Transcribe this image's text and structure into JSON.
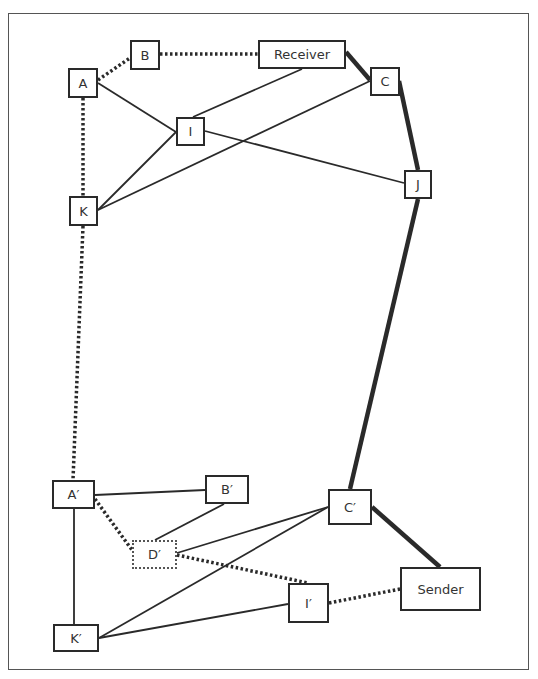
{
  "diagram": {
    "frame": {
      "x": 8,
      "y": 13,
      "w": 521,
      "h": 657
    },
    "nodes": {
      "A": {
        "label": "A",
        "x": 68,
        "y": 68,
        "w": 30,
        "h": 30
      },
      "B": {
        "label": "B",
        "x": 130,
        "y": 40,
        "w": 30,
        "h": 30
      },
      "Receiver": {
        "label": "Receiver",
        "x": 258,
        "y": 40,
        "w": 88,
        "h": 29
      },
      "C": {
        "label": "C",
        "x": 370,
        "y": 67,
        "w": 30,
        "h": 29
      },
      "I": {
        "label": "I",
        "x": 176,
        "y": 117,
        "w": 29,
        "h": 29
      },
      "J": {
        "label": "J",
        "x": 404,
        "y": 170,
        "w": 28,
        "h": 29
      },
      "K": {
        "label": "K",
        "x": 69,
        "y": 196,
        "w": 29,
        "h": 30
      },
      "A_prime": {
        "label": "A′",
        "x": 52,
        "y": 480,
        "w": 43,
        "h": 29
      },
      "B_prime": {
        "label": "B′",
        "x": 205,
        "y": 475,
        "w": 44,
        "h": 29
      },
      "C_prime": {
        "label": "C′",
        "x": 328,
        "y": 489,
        "w": 44,
        "h": 36
      },
      "D_prime": {
        "label": "D′",
        "x": 132,
        "y": 540,
        "w": 45,
        "h": 29,
        "style": "dotted"
      },
      "I_prime": {
        "label": "I′",
        "x": 288,
        "y": 583,
        "w": 41,
        "h": 40
      },
      "Sender": {
        "label": "Sender",
        "x": 400,
        "y": 567,
        "w": 81,
        "h": 44
      },
      "K_prime": {
        "label": "K′",
        "x": 53,
        "y": 624,
        "w": 46,
        "h": 28
      }
    },
    "edges": [
      {
        "from": "A",
        "to": "B",
        "style": "dotted",
        "x1": 98,
        "y1": 80,
        "x2": 130,
        "y2": 58
      },
      {
        "from": "B",
        "to": "Receiver",
        "style": "dotted",
        "x1": 160,
        "y1": 54,
        "x2": 258,
        "y2": 54
      },
      {
        "from": "Receiver",
        "to": "C",
        "style": "thick",
        "x1": 346,
        "y1": 52,
        "x2": 370,
        "y2": 80
      },
      {
        "from": "A",
        "to": "I",
        "style": "solid",
        "x1": 98,
        "y1": 83,
        "x2": 176,
        "y2": 132
      },
      {
        "from": "I",
        "to": "Receiver",
        "style": "solid",
        "x1": 193,
        "y1": 117,
        "x2": 302,
        "y2": 69
      },
      {
        "from": "I",
        "to": "J",
        "style": "solid",
        "x1": 205,
        "y1": 131,
        "x2": 404,
        "y2": 183
      },
      {
        "from": "K",
        "to": "I",
        "style": "solid",
        "x1": 98,
        "y1": 210,
        "x2": 176,
        "y2": 132
      },
      {
        "from": "K",
        "to": "C",
        "style": "solid",
        "x1": 98,
        "y1": 210,
        "x2": 370,
        "y2": 81
      },
      {
        "from": "C",
        "to": "J",
        "style": "thick",
        "x1": 399,
        "y1": 81,
        "x2": 418,
        "y2": 170
      },
      {
        "from": "A",
        "to": "K",
        "style": "dotted",
        "x1": 83,
        "y1": 98,
        "x2": 83,
        "y2": 196
      },
      {
        "from": "K",
        "to": "A_prime",
        "style": "dotted",
        "x1": 83,
        "y1": 226,
        "x2": 73,
        "y2": 480
      },
      {
        "from": "J",
        "to": "C_prime",
        "style": "thick",
        "x1": 418,
        "y1": 199,
        "x2": 350,
        "y2": 489
      },
      {
        "from": "A_prime",
        "to": "B_prime",
        "style": "solid",
        "x1": 95,
        "y1": 495,
        "x2": 205,
        "y2": 490
      },
      {
        "from": "A_prime",
        "to": "D_prime",
        "style": "dotted",
        "x1": 95,
        "y1": 499,
        "x2": 132,
        "y2": 550
      },
      {
        "from": "A_prime",
        "to": "K_prime",
        "style": "solid",
        "x1": 74,
        "y1": 509,
        "x2": 74,
        "y2": 624
      },
      {
        "from": "B_prime",
        "to": "D_prime",
        "style": "solid",
        "x1": 224,
        "y1": 504,
        "x2": 155,
        "y2": 540
      },
      {
        "from": "D_prime",
        "to": "C_prime",
        "style": "solid",
        "x1": 177,
        "y1": 553,
        "x2": 328,
        "y2": 507
      },
      {
        "from": "D_prime",
        "to": "I_prime",
        "style": "dotted",
        "x1": 177,
        "y1": 555,
        "x2": 308,
        "y2": 583
      },
      {
        "from": "K_prime",
        "to": "C_prime",
        "style": "solid",
        "x1": 99,
        "y1": 638,
        "x2": 328,
        "y2": 507
      },
      {
        "from": "K_prime",
        "to": "I_prime",
        "style": "solid",
        "x1": 99,
        "y1": 638,
        "x2": 288,
        "y2": 604
      },
      {
        "from": "C_prime",
        "to": "Sender",
        "style": "thick",
        "x1": 372,
        "y1": 507,
        "x2": 440,
        "y2": 567
      },
      {
        "from": "I_prime",
        "to": "Sender",
        "style": "dotted",
        "x1": 329,
        "y1": 603,
        "x2": 400,
        "y2": 589
      }
    ],
    "colors": {
      "line": "#2a2a2a",
      "frame": "#555555",
      "text": "#333333",
      "background": "#ffffff"
    }
  }
}
